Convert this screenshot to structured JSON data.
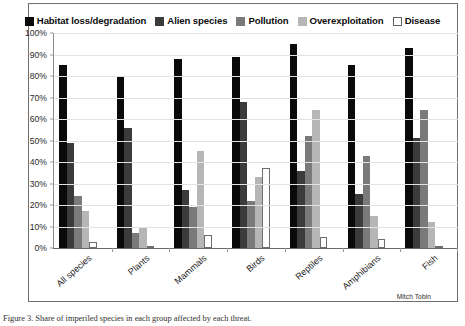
{
  "legend": {
    "position": "top-center",
    "items": [
      {
        "label": "Habitat loss/degradation",
        "color": "#0a0a0a"
      },
      {
        "label": "Alien species",
        "color": "#3b3b3b"
      },
      {
        "label": "Pollution",
        "color": "#7a7a7a"
      },
      {
        "label": "Overexploitation",
        "color": "#b6b6b6"
      },
      {
        "label": "Disease",
        "color": "#ffffff"
      }
    ]
  },
  "y_axis": {
    "ticks": [
      "100%",
      "90%",
      "80%",
      "70%",
      "60%",
      "50%",
      "40%",
      "30%",
      "20%",
      "10%",
      "0%"
    ],
    "min": 0,
    "max": 100,
    "step": 10
  },
  "credit": "Mitch Tobin",
  "caption": "Figure 3. Share of imperiled species in each group affected by each threat.",
  "chart_data": {
    "type": "bar",
    "title": "",
    "subtitle": "",
    "xlabel": "",
    "ylabel": "",
    "ylim": [
      0,
      100
    ],
    "grid": true,
    "legend_position": "top",
    "categories": [
      "All species",
      "Plants",
      "Mammals",
      "Birds",
      "Reptiles",
      "Amphibians",
      "Fish"
    ],
    "series": [
      {
        "name": "Habitat loss/degradation",
        "color": "#0a0a0a",
        "values": [
          85,
          80,
          88,
          89,
          95,
          85,
          93
        ]
      },
      {
        "name": "Alien species",
        "color": "#3b3b3b",
        "values": [
          49,
          56,
          27,
          68,
          36,
          25,
          51
        ]
      },
      {
        "name": "Pollution",
        "color": "#7a7a7a",
        "values": [
          24,
          7,
          19,
          22,
          52,
          43,
          64
        ]
      },
      {
        "name": "Overexploitation",
        "color": "#b6b6b6",
        "values": [
          17,
          10,
          45,
          33,
          64,
          15,
          12
        ]
      },
      {
        "name": "Disease",
        "color": "#ffffff",
        "values": [
          3,
          1,
          6,
          37,
          5,
          4,
          1
        ]
      }
    ]
  }
}
